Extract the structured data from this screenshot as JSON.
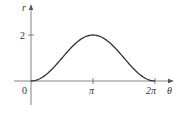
{
  "chart_data": {
    "type": "line",
    "title": "",
    "xlabel": "θ",
    "ylabel": "r",
    "x_ticks": [
      {
        "value": 0,
        "label": "0"
      },
      {
        "value": 3.14159,
        "label": "π"
      },
      {
        "value": 6.28319,
        "label": "2π"
      }
    ],
    "y_ticks": [
      {
        "value": 2,
        "label": "2"
      }
    ],
    "xlim": [
      -0.4,
      7.0
    ],
    "ylim": [
      -1.0,
      2.5
    ],
    "grid": false,
    "legend": null,
    "series": [
      {
        "name": "r = 1 - cos θ",
        "x": [
          0,
          0.785,
          1.571,
          2.356,
          3.142,
          3.927,
          4.712,
          5.498,
          6.283
        ],
        "y": [
          0,
          0.293,
          1.0,
          1.707,
          2.0,
          1.707,
          1.0,
          0.293,
          0
        ]
      }
    ]
  },
  "labels": {
    "origin": "0",
    "pi": "π",
    "two_pi": "2π",
    "x_axis": "θ",
    "y_axis": "r",
    "y_tick_2": "2"
  },
  "colors": {
    "axis": "#555555",
    "curve": "#333333",
    "text": "#333333"
  }
}
